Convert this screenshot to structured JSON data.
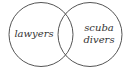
{
  "diagram": {
    "type": "venn",
    "sets": [
      {
        "label_lines": [
          "lawyers"
        ]
      },
      {
        "label_lines": [
          "scuba",
          "divers"
        ]
      }
    ],
    "colors": {
      "stroke": "#555555",
      "text": "#333333",
      "background": "#ffffff"
    }
  }
}
